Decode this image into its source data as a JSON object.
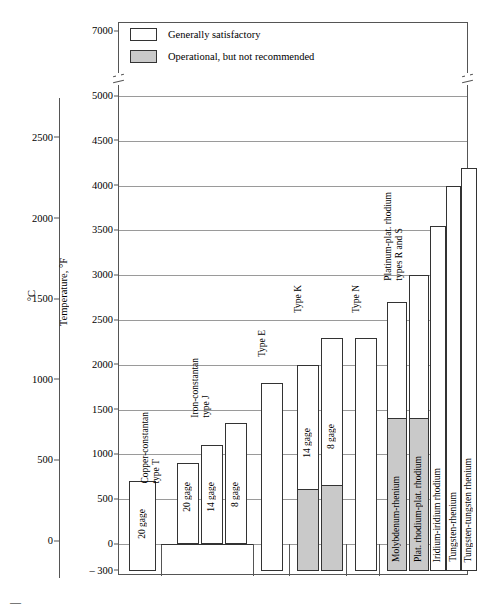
{
  "axes": {
    "left_title": "°C",
    "right_title": "Temperature, °F",
    "c_ticks": [
      "2500",
      "2000",
      "1500",
      "1000",
      "500",
      "0"
    ],
    "f_ticks": [
      "7000",
      "5000",
      "4500",
      "4000",
      "3500",
      "3000",
      "2500",
      "2000",
      "1500",
      "1000",
      "500",
      "0",
      "– 300"
    ]
  },
  "legend": {
    "satisfactory": "Generally satisfactory",
    "operational": "Operational, but not recommended"
  },
  "groups": [
    {
      "title": "Copper-constantan\ntype T"
    },
    {
      "title": "Iron-constantan\ntype J"
    },
    {
      "title": "Type E"
    },
    {
      "title": "Type K"
    },
    {
      "title": "Type N"
    },
    {
      "title": "Platinum-plat. rhodium\ntypes R and S"
    }
  ],
  "bars": [
    {
      "group": "Copper-constantan type T",
      "label": "20 gage",
      "top_f": 700,
      "bottom_f": -300,
      "gray_top_f": null
    },
    {
      "group": "Iron-constantan type J",
      "label": "20 gage",
      "top_f": 900,
      "bottom_f": 0,
      "gray_top_f": null
    },
    {
      "group": "Iron-constantan type J",
      "label": "14 gage",
      "top_f": 1100,
      "bottom_f": 0,
      "gray_top_f": null
    },
    {
      "group": "Iron-constantan type J",
      "label": "8 gage",
      "top_f": 1350,
      "bottom_f": 0,
      "gray_top_f": null
    },
    {
      "group": "Type E",
      "label": "",
      "top_f": 1800,
      "bottom_f": -300,
      "gray_top_f": null
    },
    {
      "group": "Type K",
      "label": "14 gage",
      "top_f": 2000,
      "bottom_f": -300,
      "gray_top_f": 600
    },
    {
      "group": "Type K",
      "label": "8 gage",
      "top_f": 2300,
      "bottom_f": -300,
      "gray_top_f": 650
    },
    {
      "group": "Type N",
      "label": "",
      "top_f": 2300,
      "bottom_f": -300,
      "gray_top_f": null
    },
    {
      "group": "Platinum-plat. rhodium types R and S",
      "label": "Molybdenum-rhenium",
      "top_f": 2700,
      "bottom_f": -300,
      "gray_top_f": 1400
    },
    {
      "group": "Platinum-plat. rhodium types R and S",
      "label": "Plat. rhodium-plat. rhodium",
      "top_f": 3000,
      "bottom_f": -300,
      "gray_top_f": 1400
    },
    {
      "group": "Platinum-plat. rhodium types R and S",
      "label": "Iridium-iridium rhodium",
      "top_f": 3550,
      "bottom_f": -300,
      "gray_top_f": null
    },
    {
      "group": "Platinum-plat. rhodium types R and S",
      "label": "Tungsten-rhenium",
      "top_f": 4000,
      "bottom_f": -300,
      "gray_top_f": null
    },
    {
      "group": "Platinum-plat. rhodium types R and S",
      "label": "Tungsten-tungsten rhenium",
      "top_f": 4200,
      "bottom_f": -300,
      "gray_top_f": null
    }
  ],
  "chart_data": {
    "type": "bar",
    "title": "",
    "xlabel": "",
    "ylabel": "Temperature, °F",
    "ylabel_secondary": "°C",
    "ylim": [
      -300,
      7000
    ],
    "axis_break": [
      5000,
      7000
    ],
    "grid": true,
    "legend_position": "top-left",
    "categories": [
      "Copper-constantan type T, 20 gage",
      "Iron-constantan type J, 20 gage",
      "Iron-constantan type J, 14 gage",
      "Iron-constantan type J, 8 gage",
      "Type E",
      "Type K, 14 gage",
      "Type K, 8 gage",
      "Type N",
      "Molybdenum-rhenium",
      "Plat. rhodium-plat. rhodium",
      "Iridium-iridium rhodium",
      "Tungsten-rhenium",
      "Tungsten-tungsten rhenium"
    ],
    "series": [
      {
        "name": "Generally satisfactory (upper limit, °F)",
        "values": [
          700,
          900,
          1100,
          1350,
          1800,
          2000,
          2300,
          2300,
          2700,
          3000,
          3550,
          4000,
          4200
        ]
      },
      {
        "name": "Operational, but not recommended (upper limit, °F)",
        "values": [
          null,
          null,
          null,
          null,
          null,
          600,
          650,
          null,
          1400,
          1400,
          null,
          null,
          null
        ]
      },
      {
        "name": "Lower limit (°F)",
        "values": [
          -300,
          0,
          0,
          0,
          -300,
          -300,
          -300,
          -300,
          -300,
          -300,
          -300,
          -300,
          -300
        ]
      }
    ],
    "ticks_f": [
      -300,
      0,
      500,
      1000,
      1500,
      2000,
      2500,
      3000,
      3500,
      4000,
      4500,
      5000,
      7000
    ],
    "ticks_c": [
      0,
      500,
      1000,
      1500,
      2000,
      2500
    ]
  },
  "figure_mark": "—"
}
